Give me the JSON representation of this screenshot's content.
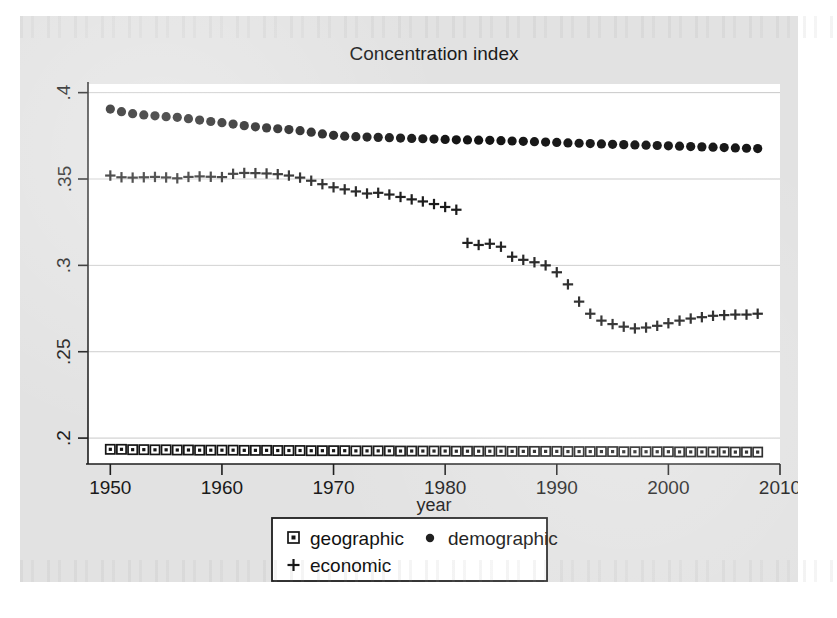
{
  "chart_data": {
    "type": "scatter",
    "title": "Concentration index",
    "xlabel": "year",
    "ylabel": "",
    "xlim": [
      1948,
      2010
    ],
    "ylim": [
      0.185,
      0.405
    ],
    "xticks": [
      1950,
      1960,
      1970,
      1980,
      1990,
      2000,
      2010
    ],
    "xtick_labels": [
      "1950",
      "1960",
      "1970",
      "1980",
      "1990",
      "2000",
      "2010"
    ],
    "yticks": [
      0.2,
      0.25,
      0.3,
      0.35,
      0.4
    ],
    "ytick_labels": [
      ".2",
      ".25",
      ".3",
      ".35",
      ".4"
    ],
    "grid": true,
    "legend_position": "below-center",
    "x": [
      1950,
      1951,
      1952,
      1953,
      1954,
      1955,
      1956,
      1957,
      1958,
      1959,
      1960,
      1961,
      1962,
      1963,
      1964,
      1965,
      1966,
      1967,
      1968,
      1969,
      1970,
      1971,
      1972,
      1973,
      1974,
      1975,
      1976,
      1977,
      1978,
      1979,
      1980,
      1981,
      1982,
      1983,
      1984,
      1985,
      1986,
      1987,
      1988,
      1989,
      1990,
      1991,
      1992,
      1993,
      1994,
      1995,
      1996,
      1997,
      1998,
      1999,
      2000,
      2001,
      2002,
      2003,
      2004,
      2005,
      2006,
      2007,
      2008
    ],
    "series": [
      {
        "name": "geographic",
        "marker": "square",
        "values": [
          0.1935,
          0.1935,
          0.1933,
          0.1933,
          0.1932,
          0.1932,
          0.1931,
          0.1931,
          0.193,
          0.193,
          0.193,
          0.193,
          0.1929,
          0.1929,
          0.1929,
          0.1928,
          0.1928,
          0.1928,
          0.1927,
          0.1927,
          0.1927,
          0.1927,
          0.1926,
          0.1926,
          0.1926,
          0.1926,
          0.1925,
          0.1925,
          0.1925,
          0.1925,
          0.1925,
          0.1924,
          0.1924,
          0.1924,
          0.1924,
          0.1924,
          0.1923,
          0.1923,
          0.1923,
          0.1923,
          0.1923,
          0.1922,
          0.1922,
          0.1922,
          0.1922,
          0.1922,
          0.1921,
          0.1921,
          0.1921,
          0.1921,
          0.1921,
          0.192,
          0.192,
          0.192,
          0.192,
          0.192,
          0.1919,
          0.1919,
          0.1919
        ]
      },
      {
        "name": "demographic",
        "marker": "circle",
        "values": [
          0.3905,
          0.389,
          0.3878,
          0.3871,
          0.3866,
          0.3861,
          0.3857,
          0.3849,
          0.3841,
          0.3833,
          0.3826,
          0.3818,
          0.3809,
          0.3802,
          0.3796,
          0.3791,
          0.3786,
          0.378,
          0.3771,
          0.3761,
          0.3753,
          0.3748,
          0.3745,
          0.3743,
          0.3741,
          0.3739,
          0.3737,
          0.3735,
          0.3733,
          0.3731,
          0.3729,
          0.3727,
          0.3726,
          0.3725,
          0.3724,
          0.3722,
          0.372,
          0.3718,
          0.3716,
          0.3714,
          0.3712,
          0.3709,
          0.3707,
          0.3705,
          0.3703,
          0.3701,
          0.3699,
          0.3697,
          0.3696,
          0.3694,
          0.3692,
          0.369,
          0.3688,
          0.3686,
          0.3684,
          0.3682,
          0.368,
          0.3678,
          0.3676
        ]
      },
      {
        "name": "economic",
        "marker": "plus",
        "values": [
          0.352,
          0.351,
          0.3508,
          0.351,
          0.3512,
          0.3509,
          0.3504,
          0.3512,
          0.3515,
          0.3513,
          0.3511,
          0.353,
          0.3535,
          0.3534,
          0.3532,
          0.3528,
          0.352,
          0.3508,
          0.349,
          0.347,
          0.3452,
          0.344,
          0.3428,
          0.3416,
          0.342,
          0.341,
          0.3396,
          0.3382,
          0.337,
          0.3355,
          0.3338,
          0.3322,
          0.313,
          0.3118,
          0.3125,
          0.3108,
          0.305,
          0.3032,
          0.3018,
          0.3,
          0.296,
          0.289,
          0.279,
          0.272,
          0.268,
          0.266,
          0.2645,
          0.2635,
          0.264,
          0.265,
          0.2665,
          0.268,
          0.2692,
          0.27,
          0.2708,
          0.2712,
          0.2715,
          0.2715,
          0.272
        ]
      }
    ]
  },
  "legend": {
    "items": [
      {
        "label": "geographic",
        "marker": "square"
      },
      {
        "label": "demographic",
        "marker": "circle"
      },
      {
        "label": "economic",
        "marker": "plus"
      }
    ]
  },
  "colors": {
    "figure_background": "#e2e2e2",
    "plot_background": "#ffffff",
    "axis": "#1d1d1d",
    "grid": "#c9c9c9",
    "marker": "#151515"
  }
}
